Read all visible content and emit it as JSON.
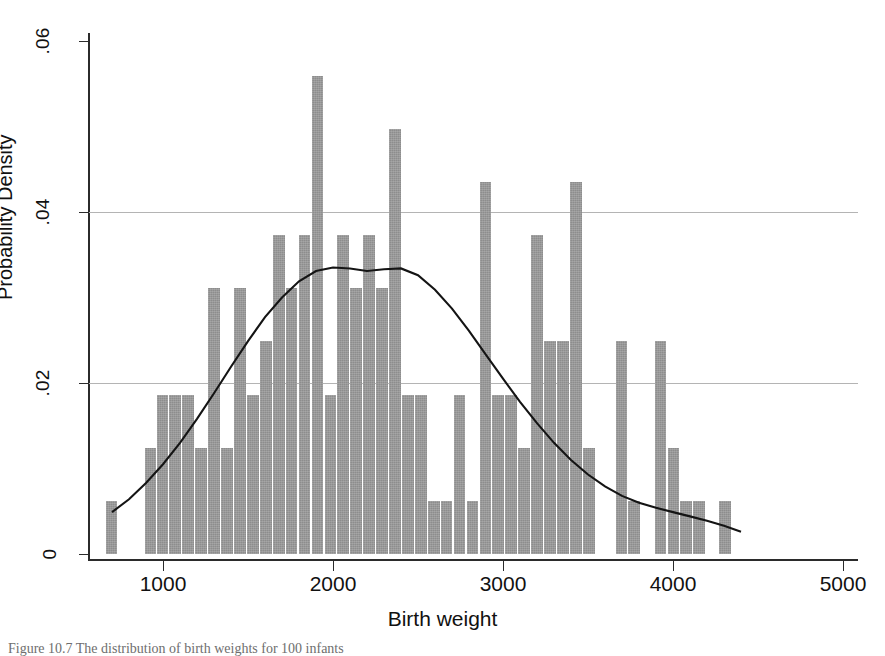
{
  "figure": {
    "caption": "Figure 10.7  The distribution of birth weights for 100 infants"
  },
  "chart_data": {
    "type": "bar",
    "title": "",
    "subtitle": "",
    "xlabel": "Birth weight",
    "ylabel": "Probability Density",
    "xlim": [
      500,
      5100
    ],
    "ylim": [
      0,
      0.062
    ],
    "xticks": [
      1000,
      2000,
      3000,
      4000,
      5000
    ],
    "xtick_labels": [
      "1000",
      "2000",
      "3000",
      "4000",
      "5000"
    ],
    "yticks": [
      0,
      0.02,
      0.04,
      0.06
    ],
    "ytick_labels": [
      "0",
      ".02",
      ".04",
      ".06"
    ],
    "gridlines_y": [
      0.02,
      0.04
    ],
    "grid": true,
    "legend": null,
    "bar_color": "#8d8d8d",
    "curve_color": "#141414",
    "bin_width": 76,
    "categories": [
      700,
      930,
      1000,
      1076,
      1152,
      1228,
      1304,
      1380,
      1456,
      1532,
      1608,
      1684,
      1760,
      1836,
      1912,
      1988,
      2064,
      2140,
      2216,
      2292,
      2368,
      2444,
      2520,
      2596,
      2672,
      2748,
      2824,
      2900,
      2976,
      3052,
      3128,
      3204,
      3280,
      3356,
      3432,
      3508,
      3700,
      3776,
      3930,
      4006,
      4082,
      4158,
      4310
    ],
    "values": [
      0.0062,
      0.0124,
      0.0186,
      0.0186,
      0.0186,
      0.0124,
      0.0311,
      0.0124,
      0.0311,
      0.0186,
      0.0249,
      0.0373,
      0.0311,
      0.0373,
      0.0559,
      0.0186,
      0.0373,
      0.0311,
      0.0373,
      0.0311,
      0.0497,
      0.0186,
      0.0186,
      0.0062,
      0.0062,
      0.0186,
      0.0062,
      0.0435,
      0.0186,
      0.0186,
      0.0124,
      0.0373,
      0.0249,
      0.0249,
      0.0435,
      0.0124,
      0.0249,
      0.0062,
      0.0249,
      0.0124,
      0.0062,
      0.0062,
      0.0062
    ],
    "series": [
      {
        "name": "Normal density curve",
        "type": "line",
        "x": [
          700,
          800,
          900,
          1000,
          1100,
          1200,
          1300,
          1400,
          1500,
          1600,
          1700,
          1800,
          1900,
          2000,
          2100,
          2200,
          2300,
          2400,
          2500,
          2600,
          2700,
          2800,
          2900,
          3000,
          3100,
          3200,
          3300,
          3400,
          3500,
          3600,
          3700,
          3800,
          3900,
          4000,
          4100,
          4200,
          4300,
          4400
        ],
        "y": [
          0.0049,
          0.0064,
          0.0083,
          0.0105,
          0.013,
          0.0158,
          0.0188,
          0.0219,
          0.0249,
          0.0277,
          0.03,
          0.0319,
          0.0331,
          0.0335,
          0.0334,
          0.0331,
          0.0333,
          0.0334,
          0.0326,
          0.0309,
          0.0287,
          0.0261,
          0.0233,
          0.0205,
          0.0178,
          0.0153,
          0.013,
          0.011,
          0.0093,
          0.0079,
          0.0068,
          0.006,
          0.0054,
          0.0049,
          0.0044,
          0.0039,
          0.0033,
          0.0026
        ]
      }
    ]
  }
}
